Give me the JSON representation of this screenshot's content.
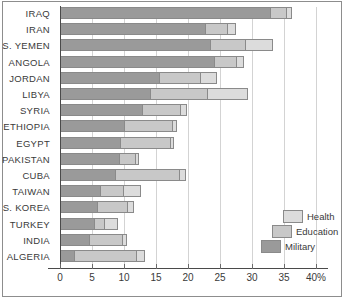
{
  "chart_data": {
    "type": "bar",
    "orientation": "horizontal",
    "stacked": true,
    "title": "",
    "subtitle": "",
    "xlabel": "",
    "ylabel": "",
    "xlim": [
      0,
      40
    ],
    "xticks": [
      0,
      5,
      10,
      15,
      20,
      25,
      30,
      35,
      40
    ],
    "xticklabels": [
      "0",
      "5",
      "10",
      "15",
      "20",
      "25",
      "30",
      "35",
      "40%"
    ],
    "grid": "vertical",
    "legend_position": "bottom-right",
    "legend": [
      "Health",
      "Education",
      "Military"
    ],
    "series": [
      {
        "name": "Military",
        "color": "#9a9a9a",
        "values": [
          33.0,
          22.8,
          23.6,
          24.2,
          15.6,
          14.2,
          13.0,
          10.2,
          9.5,
          9.4,
          8.8,
          6.4,
          5.9,
          5.5,
          4.7,
          2.3
        ]
      },
      {
        "name": "Education",
        "color": "#c8c8c8",
        "values": [
          2.4,
          3.4,
          5.5,
          3.5,
          6.4,
          9.0,
          5.9,
          7.4,
          7.8,
          2.5,
          10.0,
          3.6,
          4.7,
          1.6,
          5.2,
          9.8
        ]
      },
      {
        "name": "Health",
        "color": "#dcdcdc",
        "values": [
          0.9,
          1.3,
          4.2,
          1.0,
          2.6,
          6.2,
          0.9,
          0.7,
          0.5,
          0.5,
          0.9,
          2.6,
          0.9,
          2.0,
          0.6,
          1.2
        ]
      }
    ],
    "categories": [
      "IRAQ",
      "IRAN",
      "S. YEMEN",
      "ANGOLA",
      "JORDAN",
      "LIBYA",
      "SYRIA",
      "ETHIOPIA",
      "EGYPT",
      "PAKISTAN",
      "CUBA",
      "TAIWAN",
      "S. KOREA",
      "TURKEY",
      "INDIA",
      "ALGERIA"
    ]
  }
}
